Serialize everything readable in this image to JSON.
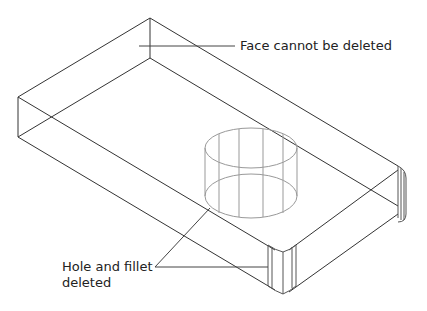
{
  "diagram": {
    "type": "isometric wireframe CAD part",
    "colors": {
      "edge": "#333333",
      "hidden_edge": "#999999",
      "leader": "#444444",
      "text": "#222222",
      "background": "#ffffff"
    },
    "annotations": [
      {
        "id": "face",
        "text": "Face cannot be deleted"
      },
      {
        "id": "hole",
        "lines": [
          "Hole and fillet",
          "deleted"
        ]
      }
    ]
  }
}
